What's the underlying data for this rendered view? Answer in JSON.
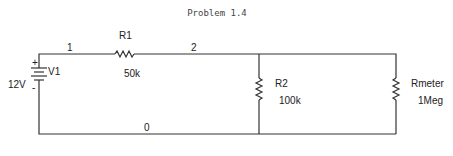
{
  "title": "Problem 1.4",
  "nodes": {
    "n1": "1",
    "n2": "2",
    "n0": "0"
  },
  "source": {
    "name": "V1",
    "value": "12V",
    "plus": "+",
    "minus": "-"
  },
  "r1": {
    "name": "R1",
    "value": "50k"
  },
  "r2": {
    "name": "R2",
    "value": "100k"
  },
  "rmeter": {
    "name": "Rmeter",
    "value": "1Meg"
  }
}
